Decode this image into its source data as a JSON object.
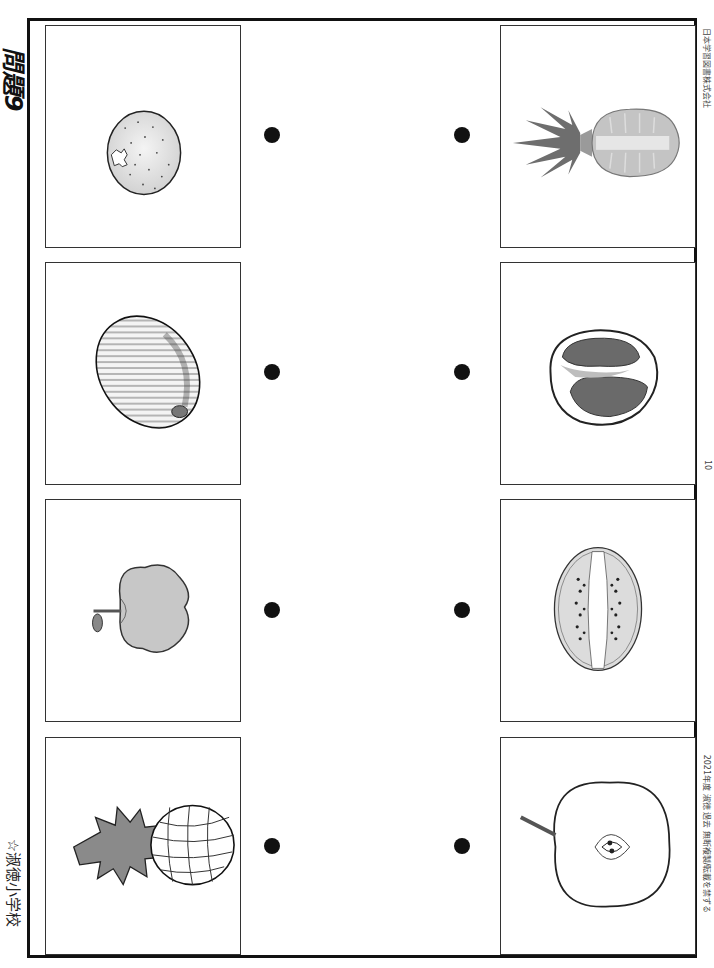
{
  "header": {
    "title": "問題9",
    "school": "☆淑徳小学校"
  },
  "footer": {
    "publisher_text": "日本学習図書株式会社",
    "page_number": "10",
    "copyright_text": "2021年度 淑徳 過去 無断複製/転載を禁ずる"
  },
  "left_column": {
    "label": "whole fruits",
    "items": [
      {
        "name": "orange",
        "icon": "orange-icon"
      },
      {
        "name": "melon",
        "icon": "melon-icon"
      },
      {
        "name": "apple",
        "icon": "apple-icon"
      },
      {
        "name": "pineapple",
        "icon": "pineapple-icon"
      }
    ]
  },
  "right_column": {
    "label": "cut fruits",
    "items": [
      {
        "name": "pineapple cross-section",
        "icon": "pineapple-cut-icon"
      },
      {
        "name": "grapefruit cross-section",
        "icon": "grapefruit-cut-icon"
      },
      {
        "name": "kiwi cross-section",
        "icon": "kiwi-cut-icon"
      },
      {
        "name": "apple cross-section",
        "icon": "apple-cut-icon"
      }
    ]
  },
  "colors": {
    "border": "#111111",
    "dot": "#111111",
    "fruit_gray": "#bdbdbd",
    "leaf_gray": "#7a7a7a"
  }
}
